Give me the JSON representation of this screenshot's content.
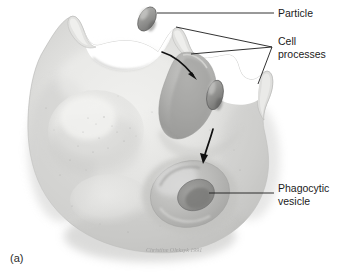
{
  "figure": {
    "panel_label": "(a)",
    "caption_signature": "Christine Oleksyk 1991",
    "palette": {
      "background": "#ffffff",
      "cell_light": "#e9e9e7",
      "cell_mid": "#d2d2d0",
      "cell_shadow": "#a9a9a7",
      "cell_dark": "#8c8c8a",
      "particle_fill": "#9b9b99",
      "particle_shadow": "#6f6f6d",
      "ink": "#1b1b1b"
    }
  },
  "labels": [
    {
      "id": "particle",
      "text": "Particle",
      "x": 278,
      "y": 16,
      "lines": 1
    },
    {
      "id": "cell-processes",
      "text": "Cell",
      "text2": "processes",
      "x": 278,
      "y": 45,
      "lines": 2
    },
    {
      "id": "phagocytic-vesicle",
      "text": "Phagocytic",
      "text2": "vesicle",
      "x": 278,
      "y": 192,
      "lines": 2
    }
  ],
  "structures": {
    "particles": [
      {
        "id": "particle-free",
        "label": "free particle above cell surface"
      },
      {
        "id": "particle-engulfed",
        "label": "particle held between cell processes"
      }
    ],
    "cell_processes_count": 3,
    "phagocytic_vesicle": {
      "label": "phagocytic vesicle crater"
    },
    "nucleus_bulge": {
      "label": "internal bulge"
    }
  },
  "arrows": [
    {
      "id": "arrow-engulf-1",
      "label": "particle moves toward cell processes"
    },
    {
      "id": "arrow-engulf-2",
      "label": "particle moves into phagocytic vesicle"
    }
  ]
}
